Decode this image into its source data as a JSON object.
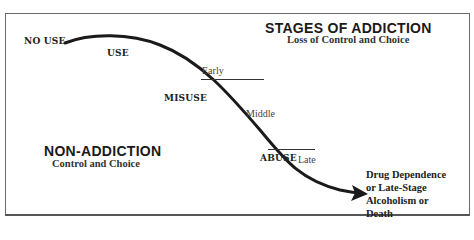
{
  "title": {
    "heading": "STAGES OF ADDICTION",
    "subheading": "Loss of Control and Choice"
  },
  "left_panel": {
    "heading": "NON-ADDICTION",
    "subheading": "Control and Choice"
  },
  "curve_labels": {
    "no_use": "NO USE",
    "use": "USE",
    "misuse": "MISUSE",
    "abuse": "ABUSE"
  },
  "stages": {
    "early": "Early",
    "middle": "Middle",
    "late": "Late"
  },
  "end_point": {
    "lines": [
      "Drug Dependence",
      "or Late-Stage",
      "Alcoholism or",
      "Death"
    ]
  },
  "colors": {
    "curve": "#1a1a1a",
    "border": "#6a6a6a",
    "text": "#222222"
  }
}
